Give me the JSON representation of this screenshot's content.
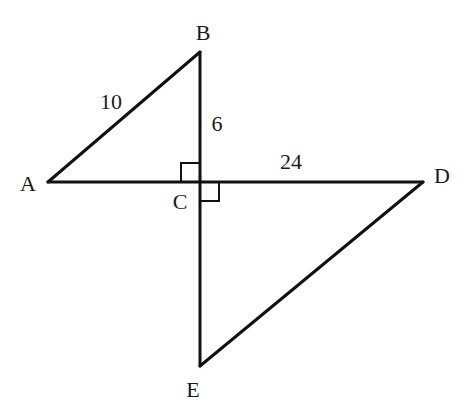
{
  "diagram": {
    "type": "geometry",
    "points": {
      "A": {
        "label": "A",
        "x": 48,
        "y": 182
      },
      "B": {
        "label": "B",
        "x": 200,
        "y": 52
      },
      "C": {
        "label": "C",
        "x": 200,
        "y": 182
      },
      "D": {
        "label": "D",
        "x": 423,
        "y": 182
      },
      "E": {
        "label": "E",
        "x": 200,
        "y": 366
      }
    },
    "segments": [
      {
        "from": "A",
        "to": "B",
        "length_label": "10"
      },
      {
        "from": "B",
        "to": "C",
        "length_label": "6"
      },
      {
        "from": "C",
        "to": "D",
        "length_label": "24"
      },
      {
        "from": "A",
        "to": "C",
        "length_label": ""
      },
      {
        "from": "C",
        "to": "E",
        "length_label": ""
      },
      {
        "from": "D",
        "to": "E",
        "length_label": ""
      }
    ],
    "right_angles": [
      {
        "at": "C",
        "between": [
          "A",
          "B"
        ]
      },
      {
        "at": "C",
        "between": [
          "D",
          "E"
        ]
      }
    ],
    "labels": {
      "A": "A",
      "B": "B",
      "C": "C",
      "D": "D",
      "E": "E",
      "AB": "10",
      "BC": "6",
      "CD": "24"
    },
    "colors": {
      "line": "#111111",
      "text": "#1a1a1a",
      "background": "#ffffff"
    }
  }
}
